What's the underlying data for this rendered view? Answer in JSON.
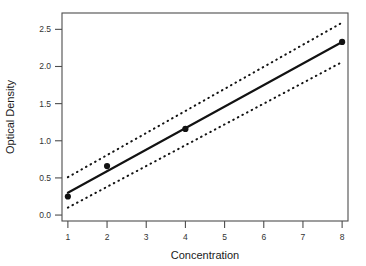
{
  "chart_data": {
    "type": "line",
    "title": "",
    "xlabel": "Concentration",
    "ylabel": "Optical Density",
    "x": [
      1,
      2,
      4,
      8
    ],
    "x_positions": [
      1,
      2,
      3,
      4,
      5,
      6,
      7,
      8
    ],
    "xtick_labels": [
      "1",
      "2",
      "3",
      "4",
      "5",
      "6",
      "7",
      "8"
    ],
    "ytick_labels": [
      "0.0",
      "0.5",
      "1.0",
      "1.5",
      "2.0",
      "2.5"
    ],
    "ytick_values": [
      0.0,
      0.5,
      1.0,
      1.5,
      2.0,
      2.5
    ],
    "xlim": [
      0.85,
      8.15
    ],
    "ylim": [
      -0.08,
      2.72
    ],
    "grid": false,
    "legend": "none",
    "series": [
      {
        "name": "Observed optical density",
        "style": "points",
        "marker": "filled-circle",
        "color": "#121212",
        "x": [
          1,
          2,
          4,
          8
        ],
        "values": [
          0.25,
          0.66,
          1.16,
          2.33
        ]
      },
      {
        "name": "Fitted calibration line",
        "style": "solid",
        "color": "#121212",
        "x": [
          1,
          8
        ],
        "values": [
          0.3,
          2.33
        ]
      },
      {
        "name": "Upper confidence limit",
        "style": "dotted",
        "color": "#121212",
        "x": [
          1,
          8
        ],
        "values": [
          0.51,
          2.59
        ]
      },
      {
        "name": "Lower confidence limit",
        "style": "dotted",
        "color": "#121212",
        "x": [
          1,
          8
        ],
        "values": [
          0.1,
          2.06
        ]
      }
    ]
  },
  "axes": {
    "x_axis_name": "concentration-axis",
    "y_axis_name": "optical-density-axis"
  }
}
